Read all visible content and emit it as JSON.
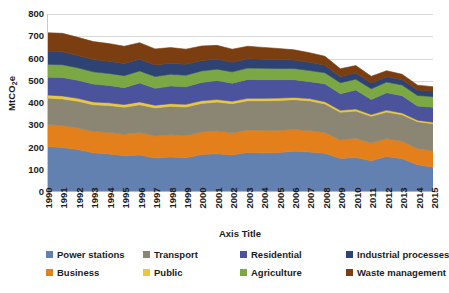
{
  "chart_data": {
    "type": "area",
    "stacked": true,
    "title": "",
    "xlabel": "Axis Title",
    "ylabel": "MtCO2e",
    "ylabel_display": "MtCO",
    "ylabel_sub": "2",
    "ylabel_suffix": "e",
    "ylim": [
      0,
      800
    ],
    "ytick_step": 100,
    "yticks": [
      800,
      700,
      600,
      500,
      400,
      300,
      200,
      100,
      0
    ],
    "grid": true,
    "legend_position": "bottom",
    "categories": [
      "1990",
      "1991",
      "1992",
      "1993",
      "1994",
      "1995",
      "1996",
      "1997",
      "1998",
      "1999",
      "2000",
      "2001",
      "2002",
      "2003",
      "2004",
      "2005",
      "2006",
      "2007",
      "2008",
      "2009",
      "2010",
      "2011",
      "2012",
      "2013",
      "2014",
      "2015"
    ],
    "series": [
      {
        "name": "Power stations",
        "color": "#6281B0",
        "values": [
          204,
          200,
          191,
          176,
          171,
          163,
          166,
          153,
          157,
          154,
          168,
          172,
          166,
          178,
          176,
          177,
          183,
          180,
          174,
          151,
          155,
          140,
          160,
          150,
          123,
          111
        ]
      },
      {
        "name": "Business",
        "color": "#E3801C",
        "values": [
          100,
          99,
          97,
          96,
          97,
          96,
          101,
          99,
          100,
          99,
          102,
          103,
          100,
          101,
          101,
          100,
          98,
          96,
          93,
          83,
          87,
          80,
          80,
          78,
          73,
          74
        ]
      },
      {
        "name": "Transport",
        "color": "#8B8674",
        "values": [
          118,
          119,
          120,
          120,
          121,
          122,
          125,
          126,
          128,
          129,
          128,
          129,
          131,
          131,
          133,
          134,
          134,
          134,
          129,
          124,
          122,
          120,
          119,
          119,
          120,
          122
        ]
      },
      {
        "name": "Public",
        "color": "#E8C83C",
        "values": [
          14,
          14,
          13,
          13,
          12,
          12,
          13,
          12,
          12,
          12,
          12,
          12,
          11,
          11,
          11,
          11,
          10,
          10,
          10,
          9,
          9,
          8,
          9,
          8,
          7,
          7
        ]
      },
      {
        "name": "Residential",
        "color": "#4A539B",
        "values": [
          80,
          83,
          81,
          80,
          78,
          76,
          85,
          76,
          79,
          79,
          82,
          85,
          81,
          85,
          84,
          83,
          80,
          76,
          80,
          75,
          85,
          68,
          78,
          78,
          63,
          67
        ]
      },
      {
        "name": "Agriculture",
        "color": "#7CA844",
        "values": [
          58,
          57,
          56,
          55,
          54,
          54,
          54,
          53,
          53,
          52,
          52,
          51,
          51,
          51,
          51,
          50,
          50,
          50,
          50,
          49,
          49,
          48,
          48,
          48,
          48,
          48
        ]
      },
      {
        "name": "Industrial processes",
        "color": "#2E4374",
        "values": [
          60,
          58,
          55,
          55,
          55,
          55,
          53,
          52,
          50,
          49,
          47,
          45,
          43,
          42,
          41,
          40,
          38,
          37,
          34,
          27,
          28,
          26,
          24,
          24,
          24,
          24
        ]
      },
      {
        "name": "Waste management",
        "color": "#7A3E10",
        "values": [
          82,
          83,
          82,
          81,
          79,
          77,
          74,
          72,
          70,
          68,
          65,
          62,
          59,
          56,
          53,
          50,
          46,
          43,
          40,
          36,
          33,
          30,
          27,
          24,
          22,
          20
        ]
      }
    ]
  },
  "axes": {
    "x_title": "Axis Title",
    "y_title_main": "MtCO",
    "y_title_sub": "2",
    "y_title_tail": "e"
  },
  "legend": {
    "items": [
      {
        "label": "Power stations",
        "color": "#6281B0"
      },
      {
        "label": "Business",
        "color": "#E3801C"
      },
      {
        "label": "Transport",
        "color": "#8B8674"
      },
      {
        "label": "Public",
        "color": "#E8C83C"
      },
      {
        "label": "Residential",
        "color": "#4A539B"
      },
      {
        "label": "Agriculture",
        "color": "#7CA844"
      },
      {
        "label": "Industrial processes",
        "color": "#2E4374"
      },
      {
        "label": "Waste management",
        "color": "#7A3E10"
      }
    ]
  }
}
